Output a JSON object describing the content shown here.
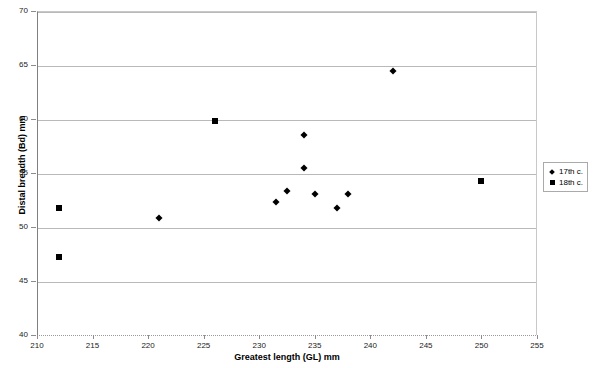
{
  "chart_data": {
    "type": "scatter",
    "title": "",
    "xlabel": "Greatest length (GL) mm",
    "ylabel": "Distal breadth (Bd) mm",
    "xlim": [
      210,
      255
    ],
    "ylim": [
      40,
      70
    ],
    "xticks": [
      210,
      215,
      220,
      225,
      230,
      235,
      240,
      245,
      250,
      255
    ],
    "yticks": [
      40,
      45,
      50,
      55,
      60,
      65,
      70
    ],
    "grid": "horizontal",
    "legend_position": "right",
    "series": [
      {
        "name": "17th c.",
        "marker": "diamond",
        "color": "#000000",
        "points": [
          [
            221.0,
            50.8
          ],
          [
            231.5,
            52.3
          ],
          [
            232.5,
            53.3
          ],
          [
            234.0,
            58.5
          ],
          [
            234.0,
            55.5
          ],
          [
            235.0,
            53.1
          ],
          [
            237.0,
            51.8
          ],
          [
            238.0,
            53.1
          ],
          [
            242.0,
            64.4
          ]
        ]
      },
      {
        "name": "18th c.",
        "marker": "square",
        "color": "#000000",
        "points": [
          [
            212.0,
            51.8
          ],
          [
            212.0,
            47.2
          ],
          [
            226.0,
            59.8
          ],
          [
            250.0,
            54.3
          ]
        ]
      }
    ]
  },
  "legend": {
    "items": [
      {
        "label": "17th c.",
        "marker": "diamond"
      },
      {
        "label": "18th c.",
        "marker": "square"
      }
    ]
  }
}
